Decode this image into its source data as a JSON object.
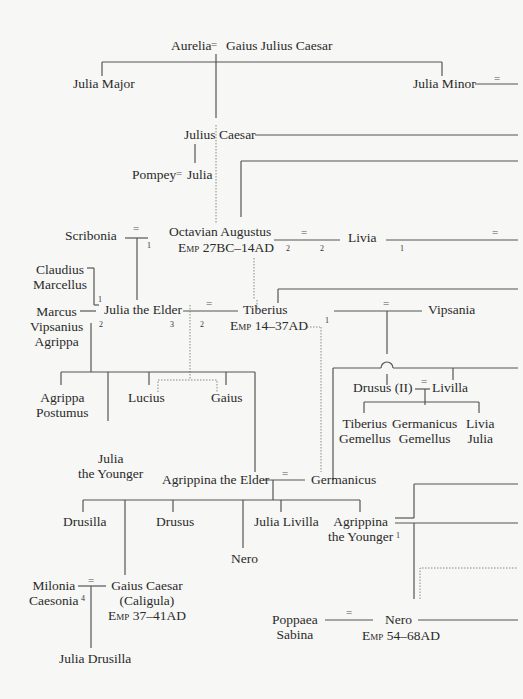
{
  "people": {
    "aurelia": "Aurelia",
    "gaius_julius_caesar": "Gaius Julius Caesar",
    "julia_major": "Julia Major",
    "julia_minor": "Julia Minor",
    "julius_caesar": "Julius Caesar",
    "pompey": "Pompey",
    "julia": "Julia",
    "scribonia": "Scribonia",
    "octavian": "Octavian Augustus",
    "octavian_reign": "Emp 27BC–14AD",
    "livia": "Livia",
    "claudius_marcellus_1": "Claudius",
    "claudius_marcellus_2": "Marcellus",
    "marcus_1": "Marcus",
    "marcus_2": "Vipsanius",
    "marcus_3": "Agrippa",
    "julia_elder": "Julia the Elder",
    "tiberius": "Tiberius",
    "tiberius_reign": "Emp 14–37AD",
    "vipsania": "Vipsania",
    "agrippa_postumus_1": "Agrippa",
    "agrippa_postumus_2": "Postumus",
    "lucius": "Lucius",
    "gaius": "Gaius",
    "drusus_ii": "Drusus (II)",
    "livilla": "Livilla",
    "tiberius_gemellus_1": "Tiberius",
    "tiberius_gemellus_2": "Gemellus",
    "germanicus_gemellus_1": "Germanicus",
    "germanicus_gemellus_2": "Gemellus",
    "livia_julia_1": "Livia",
    "livia_julia_2": "Julia",
    "julia_younger_1": "Julia",
    "julia_younger_2": "the Younger",
    "agrippina_elder": "Agrippina the Elder",
    "germanicus": "Germanicus",
    "drusilla": "Drusilla",
    "drusus": "Drusus",
    "julia_livilla": "Julia Livilla",
    "agrippina_younger_1": "Agrippina",
    "agrippina_younger_2": "the Younger",
    "nero_son": "Nero",
    "milonia_1": "Milonia",
    "milonia_2": "Caesonia",
    "caligula_1": "Gaius Caesar",
    "caligula_2": "(Caligula)",
    "caligula_reign": "Emp 37–41AD",
    "poppaea_1": "Poppaea",
    "poppaea_2": "Sabina",
    "nero": "Nero",
    "nero_reign": "Emp 54–68AD",
    "julia_drusilla": "Julia Drusilla"
  },
  "marks": {
    "eq": "=",
    "n1": "1",
    "n2": "2",
    "n3": "3",
    "n4": "4"
  }
}
